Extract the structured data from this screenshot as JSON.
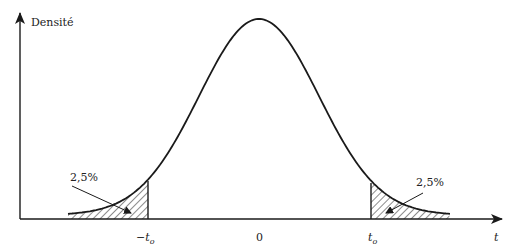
{
  "chart_data": {
    "type": "area",
    "title": "",
    "ylabel": "Densité",
    "xlabel": "t",
    "distribution": "bell-shaped density centered at 0",
    "x_ticks": [
      "-t_o",
      "0",
      "t_o"
    ],
    "shaded_regions": [
      {
        "name": "left-tail",
        "range": [
          "-inf",
          "-t_o"
        ],
        "label": "2,5%"
      },
      {
        "name": "right-tail",
        "range": [
          "t_o",
          "+inf"
        ],
        "label": "2,5%"
      }
    ],
    "grid": false,
    "legend": null
  },
  "labels": {
    "y_axis": "Densité",
    "x_axis": "t",
    "tick_neg_t": "−t",
    "tick_neg_sub": "o",
    "tick_zero": "0",
    "tick_pos_t": "t",
    "tick_pos_sub": "o",
    "left_area": "2,5%",
    "right_area": "2,5%"
  },
  "colors": {
    "stroke": "#1a1a1a",
    "background": "#ffffff"
  }
}
